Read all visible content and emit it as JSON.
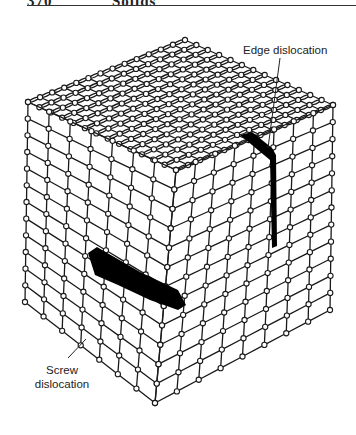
{
  "header": {
    "page_number": "370",
    "chapter_title": "Solids"
  },
  "figure": {
    "type": "crystal-lattice-cube",
    "labels": {
      "edge": "Edge dislocation",
      "screw_line1": "Screw",
      "screw_line2": "dislocation"
    },
    "colors": {
      "line": "#1a1a1a",
      "atom_fill": "#ffffff",
      "dislocation_fill": "#000000",
      "background": "#ffffff"
    },
    "geometry": {
      "top": [
        185,
        40
      ],
      "left_top": [
        28,
        102
      ],
      "right_top": [
        333,
        105
      ],
      "front_top": [
        176,
        170
      ],
      "left_bottom": [
        25,
        302
      ],
      "right_bottom": [
        330,
        310
      ],
      "front_bottom": [
        155,
        403
      ]
    }
  }
}
